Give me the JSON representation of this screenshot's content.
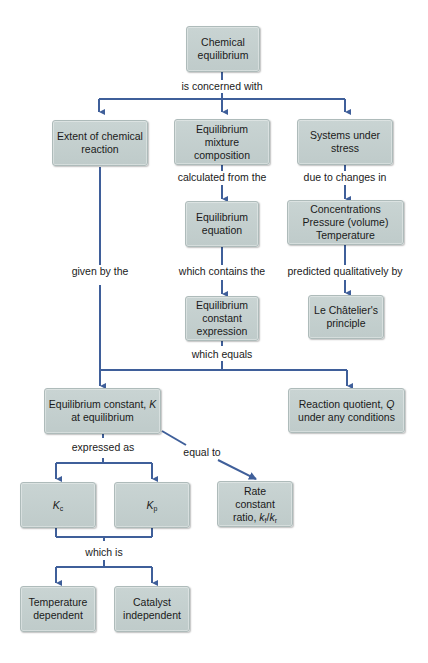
{
  "diagram": {
    "type": "concept-map",
    "line_color": "#3f5f9a",
    "node_fill": "#c6d1d0",
    "nodes": {
      "chemical_equilibrium": "Chemical equilibrium",
      "extent_of_reaction": "Extent of chemical reaction",
      "mixture_composition": "Equilibrium mixture composition",
      "systems_under_stress": "Systems under stress",
      "equilibrium_equation": "Equilibrium equation",
      "changes": {
        "line1": "Concentrations",
        "line2": "Pressure (volume)",
        "line3": "Temperature"
      },
      "constant_expression": "Equilibrium constant expression",
      "le_chatelier": "Le Châtelier's principle",
      "equilibrium_constant": {
        "prefix": "Equilibrium constant, ",
        "symbol": "K",
        "suffix": "at equilibrium"
      },
      "reaction_quotient": {
        "prefix": "Reaction quotient, ",
        "symbol": "Q",
        "suffix": "under any conditions"
      },
      "kc": {
        "symbol": "K",
        "sub": "c"
      },
      "kp": {
        "symbol": "K",
        "sub": "p"
      },
      "rate_ratio": {
        "line1": "Rate",
        "line2": "constant",
        "prefix": "ratio, ",
        "kf": "k",
        "kf_sub": "f",
        "slash": "/",
        "kr": "k",
        "kr_sub": "r"
      },
      "temperature_dependent": "Temperature dependent",
      "catalyst_independent": "Catalyst independent"
    },
    "links": {
      "is_concerned_with": "is concerned with",
      "calculated_from_the": "calculated from the",
      "due_to_changes_in": "due to changes in",
      "given_by_the": "given by the",
      "which_contains_the": "which contains the",
      "predicted_qualitatively_by": "predicted qualitatively by",
      "which_equals": "which equals",
      "expressed_as": "expressed as",
      "equal_to": "equal to",
      "which_is": "which is"
    }
  }
}
